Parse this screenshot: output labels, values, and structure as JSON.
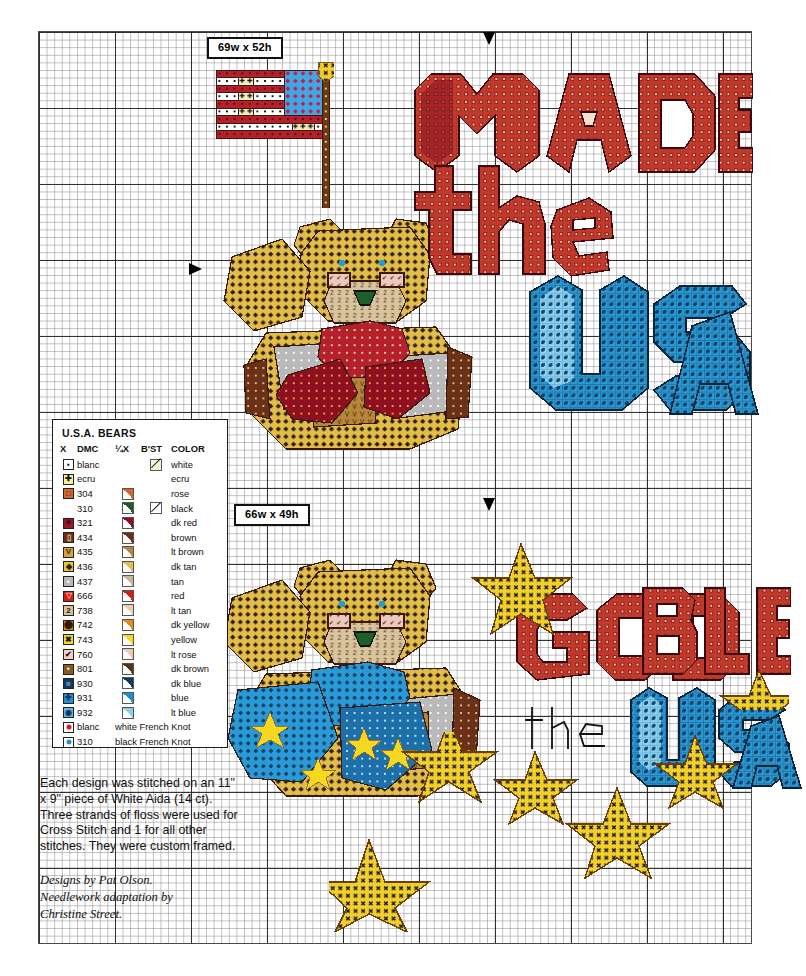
{
  "page": {
    "background": "#ffffff"
  },
  "chart": {
    "grid": {
      "cell_px": 7.6,
      "bold_every": 10,
      "minor_color": "#8c8c8c",
      "major_color": "#282828",
      "border_color": "#4a4a4a"
    },
    "size_tags": [
      {
        "name": "design-1-size",
        "text": "69w x 52h"
      },
      {
        "name": "design-2-size",
        "text": "66w x 49h"
      }
    ],
    "center_arrows": [
      {
        "name": "top-center-arrow-design-1",
        "direction": "down"
      },
      {
        "name": "left-center-arrow-design-1",
        "direction": "right"
      },
      {
        "name": "top-center-arrow-design-2",
        "direction": "down"
      },
      {
        "name": "left-center-arrow-design-2",
        "direction": "right"
      }
    ],
    "designs": [
      {
        "name": "made-in-the-usa",
        "words": [
          "MADE",
          "IN",
          "the",
          "USA"
        ],
        "motifs": [
          "american-flag",
          "teddy-bear-with-red-bow"
        ]
      },
      {
        "name": "god-bless-the-usa",
        "words": [
          "GOD",
          "BLESS",
          "the",
          "USA"
        ],
        "motifs": [
          "teddy-bear-with-blue-bow",
          "stars"
        ]
      }
    ]
  },
  "legend": {
    "title": "U.S.A.  BEARS",
    "headers": {
      "symbol": "X",
      "dmc": "DMC",
      "quarter": "¼X",
      "backstitch": "B'ST",
      "color": "COLOR"
    },
    "rows": [
      {
        "symbol": "▪",
        "sym_bg": "#ffffff",
        "sym_fg": "#111111",
        "dmc": "blanc",
        "quarter": null,
        "backstitch": "#f6f2d8",
        "color": "white",
        "swatch": "#ffffff"
      },
      {
        "symbol": "✚",
        "sym_bg": "#f4ef9c",
        "sym_fg": "#111111",
        "dmc": "ecru",
        "quarter": null,
        "backstitch": null,
        "color": "ecru",
        "swatch": "#f2ecc6"
      },
      {
        "symbol": "□",
        "sym_bg": "#d4662e",
        "sym_fg": "#3a1608",
        "dmc": "304",
        "quarter": "#d4662e",
        "backstitch": null,
        "color": "rose",
        "swatch": "#c2452a"
      },
      {
        "symbol": "",
        "sym_bg": "#ffffff",
        "sym_fg": "#111111",
        "dmc": "310",
        "quarter": "#1d5e2a",
        "backstitch": "#ffffff",
        "color": "black",
        "swatch": "#111111"
      },
      {
        "symbol": "✶",
        "sym_bg": "#a0142a",
        "sym_fg": "#2a0208",
        "dmc": "321",
        "quarter": "#8e1020",
        "backstitch": null,
        "color": "dk red",
        "swatch": "#a0142a"
      },
      {
        "symbol": "▯",
        "sym_bg": "#6b3118",
        "sym_fg": "#f0d0a0",
        "dmc": "434",
        "quarter": "#6b3118",
        "backstitch": null,
        "color": "brown",
        "swatch": "#6b3118"
      },
      {
        "symbol": "V",
        "sym_bg": "#d6a23a",
        "sym_fg": "#3a2206",
        "dmc": "435",
        "quarter": "#b8863a",
        "backstitch": null,
        "color": "lt brown",
        "swatch": "#b8863a"
      },
      {
        "symbol": "◆",
        "sym_bg": "#e8c33c",
        "sym_fg": "#2b1c02",
        "dmc": "436",
        "quarter": "#e3bd4a",
        "backstitch": null,
        "color": "dk tan",
        "swatch": "#e3bd4a"
      },
      {
        "symbol": "▪",
        "sym_bg": "#b8b8b8",
        "sym_fg": "#ffffff",
        "dmc": "437",
        "quarter": "#c9b79a",
        "backstitch": null,
        "color": "tan",
        "swatch": "#c9b79a"
      },
      {
        "symbol": "▽",
        "sym_bg": "#d81b14",
        "sym_fg": "#f3c8bc",
        "dmc": "666",
        "quarter": "#d81b14",
        "backstitch": null,
        "color": "red",
        "swatch": "#d81b14"
      },
      {
        "symbol": "2",
        "sym_bg": "#d6c09a",
        "sym_fg": "#2b1c02",
        "dmc": "738",
        "quarter": "#e5d2b0",
        "backstitch": null,
        "color": "lt tan",
        "swatch": "#e5d2b0"
      },
      {
        "symbol": "⬤",
        "sym_bg": "#e07c12",
        "sym_fg": "#2b1c02",
        "dmc": "742",
        "quarter": "#e88a16",
        "backstitch": null,
        "color": "dk yellow",
        "swatch": "#e88a16"
      },
      {
        "symbol": "✖",
        "sym_bg": "#f5d822",
        "sym_fg": "#111111",
        "dmc": "743",
        "quarter": "#f5d822",
        "backstitch": null,
        "color": "yellow",
        "swatch": "#f5d822"
      },
      {
        "symbol": "✔",
        "sym_bg": "#f2cfc2",
        "sym_fg": "#111111",
        "dmc": "760",
        "quarter": "#f0c8bb",
        "backstitch": null,
        "color": "lt rose",
        "swatch": "#f0c8bb"
      },
      {
        "symbol": "▪",
        "sym_bg": "#8a5a1e",
        "sym_fg": "#ffffff",
        "dmc": "801",
        "quarter": "#5a3310",
        "backstitch": null,
        "color": "dk brown",
        "swatch": "#5a3310"
      },
      {
        "symbol": "■",
        "sym_bg": "#14385e",
        "sym_fg": "#4d86bd",
        "dmc": "930",
        "quarter": "#14385e",
        "backstitch": null,
        "color": "dk blue",
        "swatch": "#14385e"
      },
      {
        "symbol": "✚",
        "sym_bg": "#1f8fd4",
        "sym_fg": "#0b2f52",
        "dmc": "931",
        "quarter": "#1f8fd4",
        "backstitch": null,
        "color": "blue",
        "swatch": "#1f8fd4"
      },
      {
        "symbol": "◉",
        "sym_bg": "#5fb8e8",
        "sym_fg": "#0b2f52",
        "dmc": "932",
        "quarter": "#8cd0f0",
        "backstitch": null,
        "color": "lt blue",
        "swatch": "#8cd0f0"
      }
    ],
    "french_knots": [
      {
        "symbol": "●",
        "sym_bg": "#ffffff",
        "dot_color": "#d81b14",
        "dmc": "blanc",
        "label": "white French Knot"
      },
      {
        "symbol": "●",
        "sym_bg": "#ffffff",
        "dot_color": "#1f8fd4",
        "dmc": "310",
        "label": "black French Knot"
      }
    ]
  },
  "notes": {
    "body": "Each design was stitched on an 11\" x 9\" piece of White Aida (14 ct). Three strands of floss were used for Cross Stitch and 1 for all other stitches. They were custom framed.",
    "credits_line1": "Designs by Pat Olson.",
    "credits_line2": "Needlework adaptation by",
    "credits_line3": "Christine Street."
  }
}
